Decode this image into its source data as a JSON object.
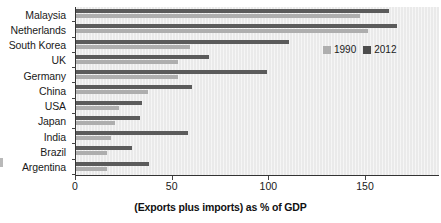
{
  "chart_data": {
    "type": "bar",
    "orientation": "horizontal",
    "title": "",
    "subtitle": "",
    "xlabel": "(Exports plus imports) as % of GDP",
    "ylabel": "",
    "xlim": [
      0,
      170
    ],
    "xticks": [
      0,
      50,
      100,
      150
    ],
    "xtick_labels": [
      "0",
      "50",
      "100",
      "150"
    ],
    "grid": false,
    "legend_position": "top-right",
    "categories": [
      "Malaysia",
      "Netherlands",
      "South Korea",
      "UK",
      "Germany",
      "China",
      "USA",
      "Japan",
      "India",
      "Brazil",
      "Argentina"
    ],
    "series": [
      {
        "name": "1990",
        "color": "#aeaeae",
        "values": [
          147,
          151,
          59,
          53,
          53,
          37,
          22,
          20,
          18,
          16,
          16
        ]
      },
      {
        "name": "2012",
        "color": "#5b5b5b",
        "values": [
          162,
          166,
          110,
          69,
          99,
          60,
          34,
          33,
          58,
          29,
          38
        ]
      }
    ]
  },
  "legend": {
    "items": [
      {
        "label": "1990",
        "color": "#aeaeae"
      },
      {
        "label": "2012",
        "color": "#4d4d4d"
      }
    ]
  },
  "axis": {
    "x_title": "(Exports plus imports) as % of GDP",
    "tick_labels": [
      "0",
      "50",
      "100",
      "150"
    ]
  },
  "colors": {
    "plot_background": "#eaeaea",
    "page_background": "#ffffff",
    "axis": "#333333",
    "series_1990": "#aeaeae",
    "series_2012": "#5b5b5b",
    "text": "#1a1a1a"
  }
}
